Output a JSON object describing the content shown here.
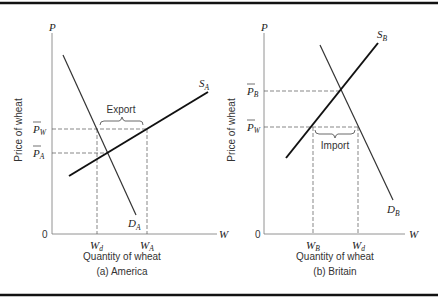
{
  "figure": {
    "panels": [
      {
        "id": "a",
        "caption": "(a) America",
        "x_axis_label": "Quantity of wheat",
        "y_axis_label": "Price of wheat",
        "axis_p": "P",
        "axis_w": "W",
        "origin": "0",
        "supply_label": "S",
        "supply_sub": "A",
        "demand_label": "D",
        "demand_sub": "A",
        "price_world": "P",
        "price_world_sub": "W",
        "price_domestic": "P",
        "price_domestic_sub": "A",
        "qty_left": "W",
        "qty_left_sub": "d",
        "qty_right": "W",
        "qty_right_sub": "A",
        "trade_label": "Export"
      },
      {
        "id": "b",
        "caption": "(b) Britain",
        "x_axis_label": "Quantity of wheat",
        "y_axis_label": "Price of wheat",
        "axis_p": "P",
        "axis_w": "W",
        "origin": "0",
        "supply_label": "S",
        "supply_sub": "B",
        "demand_label": "D",
        "demand_sub": "B",
        "price_domestic": "P",
        "price_domestic_sub": "B",
        "price_world": "P",
        "price_world_sub": "W",
        "qty_left": "W",
        "qty_left_sub": "B",
        "qty_right": "W",
        "qty_right_sub": "d",
        "trade_label": "Import"
      }
    ]
  }
}
